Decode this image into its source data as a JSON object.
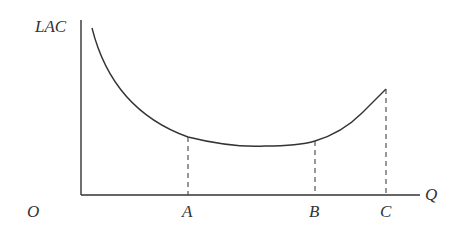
{
  "diagram": {
    "y_axis_label": "LAC",
    "x_axis_label": "Q",
    "origin_label": "O",
    "points": [
      {
        "label": "A",
        "x": 188,
        "curve_y": 137
      },
      {
        "label": "B",
        "x": 315,
        "curve_y": 141
      },
      {
        "label": "C",
        "x": 386,
        "curve_y": 89
      }
    ],
    "colors": {
      "line": "#333333",
      "background": "#ffffff"
    }
  }
}
